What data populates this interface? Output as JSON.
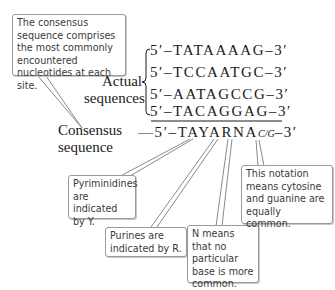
{
  "callouts": {
    "consensus_def": "The consensus sequence comprises the most commonly encountered nucleotides at each site.",
    "pyrimidines": "Pyriminidines are indicated by Y.",
    "purines": "Purines are indicated by R.",
    "n_means": "N means that no particular base is more common.",
    "notation": "This notation means cytosine and guanine are equally common."
  },
  "labels": {
    "actual_line1": "Actual",
    "actual_line2": "sequences",
    "consensus_line1": "Consensus",
    "consensus_line2": "sequence"
  },
  "sequences": [
    "5′–TATAAAAG–3′",
    "5′–TCCAATGC–3′",
    "5′–AATAGCCG–3′",
    "5′–TACAGGAG–3′"
  ],
  "consensus": {
    "prefix": "—5′–TAYARNA",
    "cg": "C/G",
    "suffix": "–3′"
  },
  "colors": {
    "box_border": "#9a9a9a",
    "text": "#1a1a1a",
    "callout_text": "#3a3a3a"
  }
}
